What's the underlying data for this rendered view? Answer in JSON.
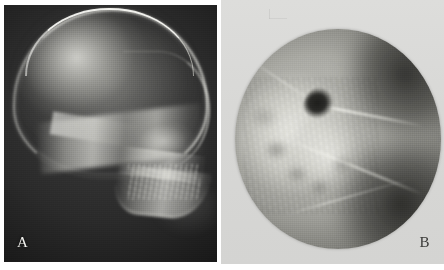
{
  "figure": {
    "type": "two-panel radiographic figure",
    "background_color": "#ffffff",
    "width": 444,
    "height": 270
  },
  "panels": [
    {
      "id": "a",
      "label": "A",
      "label_color": "#f2f2ee",
      "label_position": "bottom-left",
      "modality": "plain radiograph",
      "view": "lateral skull",
      "field_shape": "rectangular",
      "background_color": "#1b1b1b",
      "features": [
        "cranial vault with bright calvarial rim",
        "frontal hyperlucent hot spot",
        "skull base band",
        "orbital roof",
        "mastoid region",
        "maxilla and dental arch",
        "mandible body and ramus",
        "cervical soft tissue"
      ]
    },
    {
      "id": "b",
      "label": "B",
      "label_color": "#3a3a38",
      "label_position": "bottom-right",
      "modality": "coned-down radiograph",
      "view": "collimated circular detail view",
      "field_shape": "circular",
      "background_color": "#d9d9d7",
      "cone_color": "#6f6f6a",
      "features": [
        "circular collimation edge",
        "bright trabecular bone mass",
        "dark radiolucent lesion",
        "cortical ridge lines",
        "darker soft tissue shadow upper right",
        "darker soft tissue shadow lower right"
      ]
    }
  ]
}
